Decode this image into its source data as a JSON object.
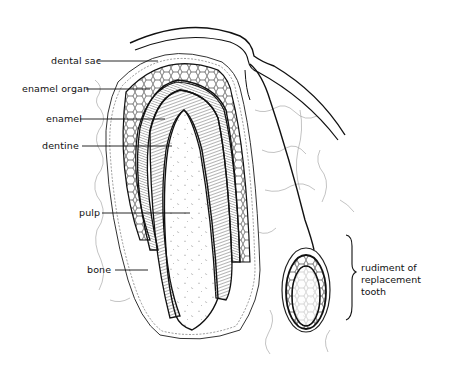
{
  "figure": {
    "colors": {
      "ink": "#111111",
      "background": "#ffffff",
      "pulp_fill": "#fbfbfb"
    }
  },
  "labels": {
    "dental_sac": "dental sac",
    "enamel_organ": "enamel organ",
    "enamel": "enamel",
    "dentine": "dentine",
    "pulp": "pulp",
    "bone": "bone",
    "rudiment": [
      "rudiment of",
      "replacement",
      "tooth"
    ]
  }
}
